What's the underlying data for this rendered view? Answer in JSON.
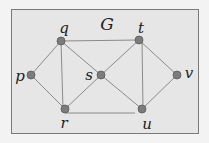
{
  "graph": {
    "title": "G",
    "colors": {
      "background": "#f3f3f3",
      "frame_fill": "#e6e6e6",
      "frame_stroke": "#7a7a7a",
      "edge": "#8a8a8a",
      "node_fill": "#7c7c7c",
      "node_stroke": "#5a5a5a",
      "label": "#1c1c1c"
    },
    "nodes": [
      {
        "id": "p",
        "label": "p",
        "x": 31,
        "y": 75
      },
      {
        "id": "q",
        "label": "q",
        "x": 61,
        "y": 41
      },
      {
        "id": "r",
        "label": "r",
        "x": 65,
        "y": 109
      },
      {
        "id": "s",
        "label": "s",
        "x": 101,
        "y": 75
      },
      {
        "id": "t",
        "label": "t",
        "x": 139,
        "y": 40
      },
      {
        "id": "u",
        "label": "u",
        "x": 142,
        "y": 109
      },
      {
        "id": "v",
        "label": "v",
        "x": 177,
        "y": 75
      }
    ],
    "edges": [
      [
        "p",
        "q"
      ],
      [
        "p",
        "r"
      ],
      [
        "q",
        "r"
      ],
      [
        "q",
        "s"
      ],
      [
        "q",
        "t"
      ],
      [
        "r",
        "s"
      ],
      [
        "r",
        "u"
      ],
      [
        "s",
        "t"
      ],
      [
        "s",
        "u"
      ],
      [
        "t",
        "u"
      ],
      [
        "t",
        "v"
      ],
      [
        "u",
        "v"
      ]
    ]
  }
}
